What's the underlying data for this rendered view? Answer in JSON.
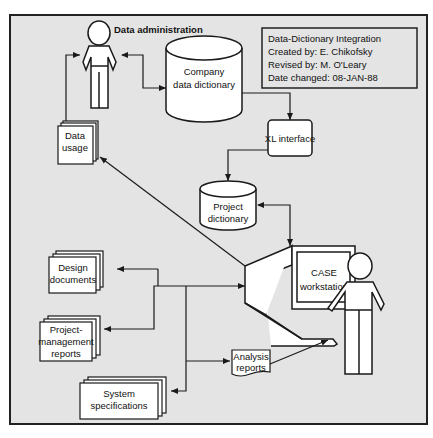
{
  "title_block": {
    "line1": "Data-Dictionary Integration",
    "line2": "Created by: E. Chikofsky",
    "line3": "Revised by: M. O'Leary",
    "line4": "Date changed: 08-JAN-88"
  },
  "nodes": {
    "data_admin": {
      "label": "Data administration",
      "icon": "person-icon"
    },
    "company_dict": {
      "line1": "Company",
      "line2": "data dictionary",
      "icon": "database-cylinder-icon"
    },
    "xl_interface": {
      "label": "XL interface"
    },
    "project_dict": {
      "line1": "Project",
      "line2": "dictionary",
      "icon": "database-cylinder-icon"
    },
    "data_usage": {
      "line1": "Data",
      "line2": "usage",
      "icon": "document-stack-icon"
    },
    "case_ws": {
      "line1": "CASE",
      "line2": "workstation",
      "icon": "computer-terminal-icon"
    },
    "design_docs": {
      "line1": "Design",
      "line2": "documents",
      "icon": "document-stack-icon"
    },
    "pm_reports": {
      "line1": "Project-",
      "line2": "management",
      "line3": "reports",
      "icon": "document-stack-icon"
    },
    "sys_specs": {
      "line1": "System",
      "line2": "specifications",
      "icon": "document-stack-icon"
    },
    "analysis_reports": {
      "line1": "Analysis",
      "line2": "reports",
      "icon": "document-icon"
    },
    "user": {
      "icon": "person-icon"
    }
  },
  "colors": {
    "background": "#e4e4e4",
    "frame": "#222222",
    "shape_fill": "#ffffff",
    "stroke": "#1a1a1a"
  }
}
